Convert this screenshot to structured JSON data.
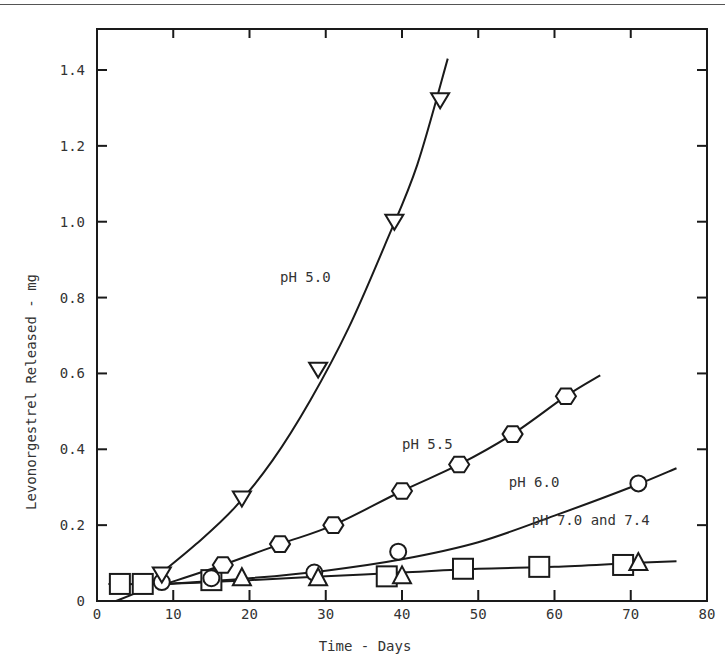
{
  "chart_data": {
    "type": "scatter",
    "title": "",
    "xlabel": "Time - Days",
    "ylabel": "Levonorgestrel Released - mg",
    "xlim": [
      0,
      80
    ],
    "ylim": [
      0,
      1.5
    ],
    "x_ticks": [
      0,
      10,
      20,
      30,
      40,
      50,
      60,
      70,
      80
    ],
    "x_tick_labels": [
      "0",
      "10",
      "20",
      "30",
      "40",
      "50",
      "60",
      "70",
      "80"
    ],
    "y_ticks": [
      0,
      0.2,
      0.4,
      0.6,
      0.8,
      1.0,
      1.2,
      1.4
    ],
    "y_tick_labels": [
      "0",
      "0.2",
      "0.4",
      "0.6",
      "0.8",
      "1.0",
      "1.2",
      "1.4"
    ],
    "grid": false,
    "legend": "inline labels next to curves",
    "series": [
      {
        "name": "pH 5.0",
        "marker": "triangle-down",
        "label_pos": [
          24,
          0.84
        ],
        "points": [
          [
            8.5,
            0.07
          ],
          [
            19,
            0.27
          ],
          [
            29,
            0.61
          ],
          [
            39,
            1.0
          ],
          [
            45,
            1.32
          ]
        ],
        "fit": [
          [
            8.5,
            0.075
          ],
          [
            13,
            0.15
          ],
          [
            18,
            0.245
          ],
          [
            23,
            0.37
          ],
          [
            28,
            0.53
          ],
          [
            33,
            0.72
          ],
          [
            38,
            0.95
          ],
          [
            42,
            1.15
          ],
          [
            46,
            1.43
          ]
        ]
      },
      {
        "name": "pH 5.5",
        "marker": "hexagon",
        "label_pos": [
          40,
          0.4
        ],
        "points": [
          [
            16.5,
            0.095
          ],
          [
            24,
            0.15
          ],
          [
            31,
            0.2
          ],
          [
            40,
            0.29
          ],
          [
            47.5,
            0.36
          ],
          [
            54.5,
            0.44
          ],
          [
            61.5,
            0.54
          ]
        ],
        "fit": [
          [
            9,
            0.045
          ],
          [
            16.5,
            0.095
          ],
          [
            24,
            0.15
          ],
          [
            31,
            0.2
          ],
          [
            40,
            0.29
          ],
          [
            47.5,
            0.36
          ],
          [
            54.5,
            0.44
          ],
          [
            61.5,
            0.54
          ],
          [
            66,
            0.595
          ]
        ]
      },
      {
        "name": "pH 6.0",
        "marker": "circle",
        "label_pos": [
          54,
          0.3
        ],
        "points": [
          [
            8.5,
            0.05
          ],
          [
            15,
            0.06
          ],
          [
            28.5,
            0.075
          ],
          [
            39.5,
            0.13
          ],
          [
            71,
            0.31
          ]
        ],
        "fit": [
          [
            9,
            0.045
          ],
          [
            20,
            0.06
          ],
          [
            30,
            0.08
          ],
          [
            40,
            0.11
          ],
          [
            50,
            0.155
          ],
          [
            60,
            0.225
          ],
          [
            70,
            0.3
          ],
          [
            76,
            0.35
          ]
        ]
      },
      {
        "name": "pH 7.0",
        "marker": "square",
        "label_pos": [
          57,
          0.2
        ],
        "points": [
          [
            3,
            0.045
          ],
          [
            6,
            0.045
          ],
          [
            15,
            0.055
          ],
          [
            38,
            0.065
          ],
          [
            48,
            0.085
          ],
          [
            58,
            0.09
          ],
          [
            69,
            0.095
          ]
        ],
        "fit": [
          [
            1.5,
            0.045
          ],
          [
            9,
            0.045
          ],
          [
            20,
            0.055
          ],
          [
            30,
            0.065
          ],
          [
            40,
            0.075
          ],
          [
            50,
            0.085
          ],
          [
            60,
            0.09
          ],
          [
            70,
            0.1
          ],
          [
            76,
            0.105
          ]
        ]
      },
      {
        "name": "pH 7.4",
        "marker": "triangle-up",
        "label_pos": [
          57,
          0.2
        ],
        "points": [
          [
            19,
            0.06
          ],
          [
            29,
            0.06
          ],
          [
            40,
            0.065
          ],
          [
            71,
            0.1
          ]
        ],
        "fit": []
      }
    ],
    "combined_label": "pH 7.0 and 7.4",
    "extra_segment": [
      [
        2.5,
        0.0
      ],
      [
        5,
        0.02
      ]
    ]
  }
}
